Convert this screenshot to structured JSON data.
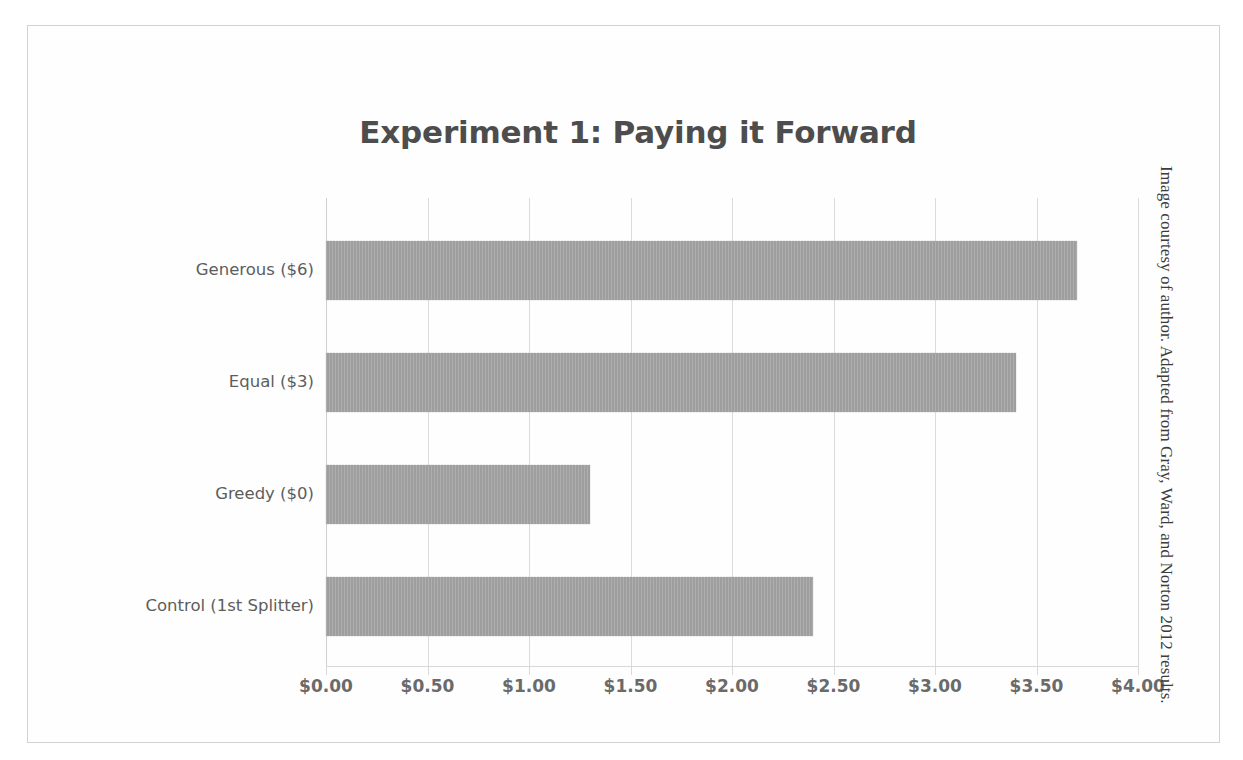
{
  "figure": {
    "title": "Experiment 1: Paying it Forward",
    "source_caption": "Image courtesy of author. Adapted from Gray, Ward, and Norton 2012 results.",
    "bar_color": "#9e9e9e",
    "title_color": "#4d4d4d",
    "gridline_color": "#dcdcdc",
    "border_color": "#d2d2d2"
  },
  "chart_data": {
    "type": "bar",
    "orientation": "horizontal",
    "title": "Experiment 1: Paying it Forward",
    "xlabel": "",
    "ylabel": "",
    "categories": [
      "Generous ($6)",
      "Equal ($3)",
      "Greedy ($0)",
      "Control (1st Splitter)"
    ],
    "values": [
      3.7,
      3.4,
      1.3,
      2.4
    ],
    "value_labels": [
      "$3.70",
      "$3.40",
      "$1.30",
      "$2.40"
    ],
    "xlim": [
      0,
      4
    ],
    "xtick_values": [
      0,
      0.5,
      1,
      1.5,
      2,
      2.5,
      3,
      3.5,
      4
    ],
    "xtick_labels": [
      "$0.00",
      "$0.50",
      "$1.00",
      "$1.50",
      "$2.00",
      "$2.50",
      "$3.00",
      "$3.50",
      "$4.00"
    ],
    "grid": true,
    "grid_axis": "x",
    "legend": false,
    "legend_position": "none",
    "series": [
      {
        "name": "Amount passed forward",
        "values": [
          3.7,
          3.4,
          1.3,
          2.4
        ]
      }
    ]
  }
}
